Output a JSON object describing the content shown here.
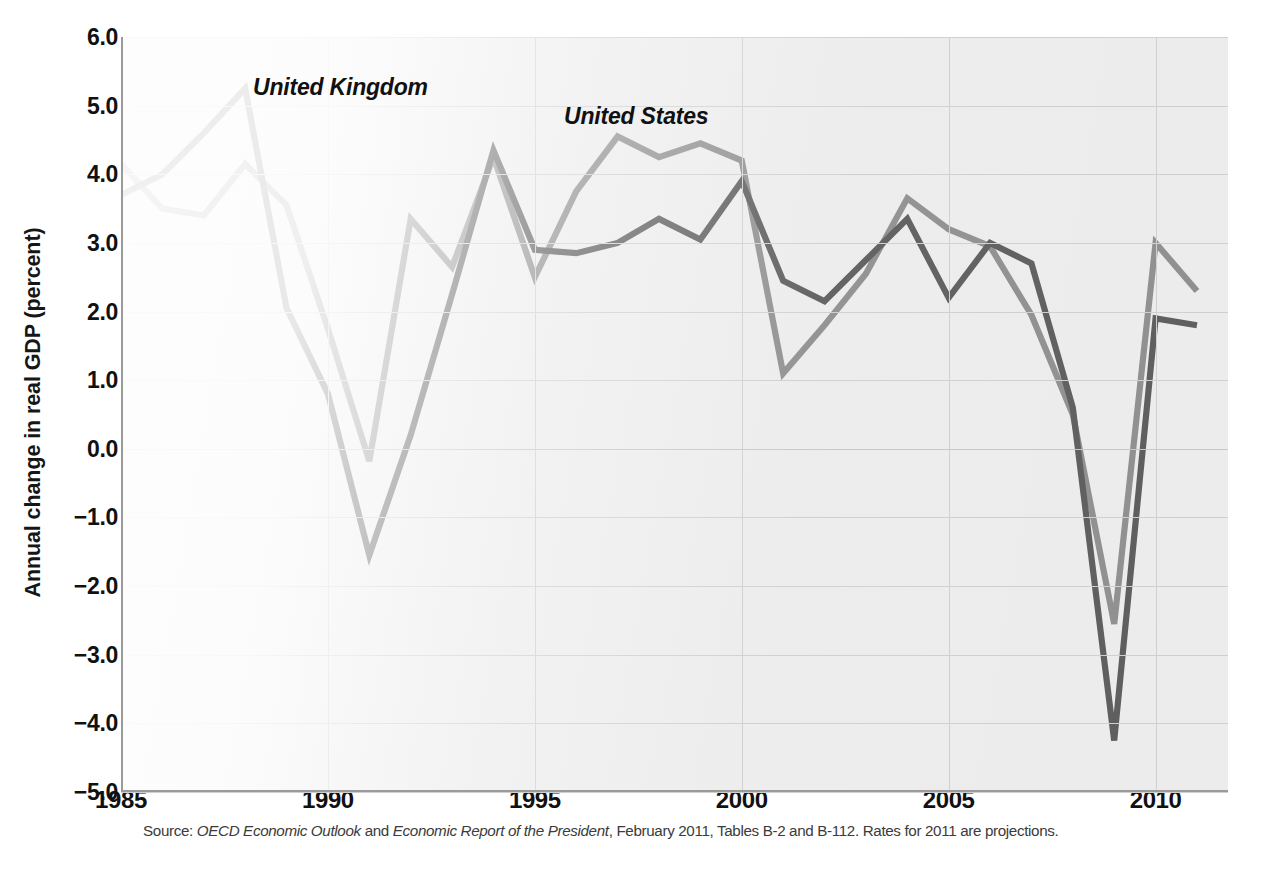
{
  "ylabel": "Annual change in real GDP (percent)",
  "yticks": [
    "6.0",
    "5.0",
    "4.0",
    "3.0",
    "2.0",
    "1.0",
    "0.0",
    "−1.0",
    "−2.0",
    "−3.0",
    "−4.0",
    "−5.0"
  ],
  "xticks": [
    "1985",
    "1990",
    "1995",
    "2000",
    "2005",
    "2010"
  ],
  "series_labels": {
    "uk": "United Kingdom",
    "us": "United States"
  },
  "source": {
    "prefix": "Source: ",
    "italic1": "OECD Economic Outlook",
    "mid": " and ",
    "italic2": "Economic Report of the President",
    "suffix": ", February 2011, Tables B-2 and B-112. Rates for 2011 are projections."
  },
  "colors": {
    "united_kingdom": "#5d5d5d",
    "united_states": "#8f8f8f",
    "plot_background": "#ececec",
    "gridline": "#cfcfcf",
    "axis": "#9a9a9a",
    "text": "#111111"
  },
  "chart_data": {
    "type": "line",
    "title": "",
    "xlabel": "",
    "ylabel": "Annual change in real GDP (percent)",
    "xlim": [
      1985,
      2011.75
    ],
    "ylim": [
      -5.0,
      6.0
    ],
    "ytick_values": [
      6.0,
      5.0,
      4.0,
      3.0,
      2.0,
      1.0,
      0.0,
      -1.0,
      -2.0,
      -3.0,
      -4.0,
      -5.0
    ],
    "xtick_values": [
      1985,
      1990,
      1995,
      2000,
      2005,
      2010
    ],
    "grid": true,
    "legend": "inline-annotations",
    "x": [
      1985,
      1986,
      1987,
      1988,
      1989,
      1990,
      1991,
      1992,
      1993,
      1994,
      1995,
      1996,
      1997,
      1998,
      1999,
      2000,
      2001,
      2002,
      2003,
      2004,
      2005,
      2006,
      2007,
      2008,
      2009,
      2010,
      2011
    ],
    "series": [
      {
        "name": "United Kingdom",
        "color": "#5d5d5d",
        "values": [
          3.7,
          4.0,
          4.6,
          5.25,
          2.05,
          0.8,
          -1.55,
          0.2,
          2.25,
          4.35,
          2.9,
          2.85,
          3.0,
          3.35,
          3.05,
          3.9,
          2.45,
          2.15,
          2.75,
          3.35,
          2.2,
          3.0,
          2.7,
          0.6,
          -4.25,
          1.9,
          1.8
        ]
      },
      {
        "name": "United States",
        "color": "#8f8f8f",
        "values": [
          4.15,
          3.5,
          3.4,
          4.15,
          3.55,
          1.75,
          -0.18,
          3.35,
          2.65,
          4.25,
          2.5,
          3.75,
          4.55,
          4.25,
          4.45,
          4.2,
          1.1,
          1.8,
          2.55,
          3.65,
          3.2,
          2.95,
          1.95,
          0.5,
          -2.55,
          3.0,
          2.3
        ]
      }
    ]
  }
}
